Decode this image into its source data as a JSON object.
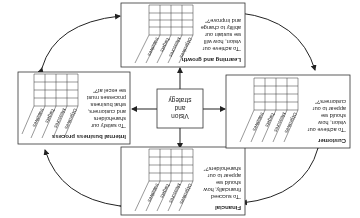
{
  "orientation": "rotated-180",
  "center": {
    "lines": [
      "Vision",
      "and",
      "strategy"
    ]
  },
  "columns": [
    "Objectives",
    "Measures",
    "Targets",
    "Initiatives"
  ],
  "perspectives": {
    "financial": {
      "title": "Financial",
      "question": [
        "“To succeed",
        "financially, how",
        "should we",
        "appear to our",
        "shareholders?”"
      ]
    },
    "customer": {
      "title": "Customer",
      "question": [
        "“To achieve our",
        "vision, how",
        "should we",
        "appear to our",
        "customers?”"
      ]
    },
    "internal": {
      "title": "Internal business process",
      "question": [
        "“To satisfy our",
        "shareholders",
        "and customers,",
        "what business",
        "processes must",
        "we excel at?”"
      ]
    },
    "learning": {
      "title": "Learning and growth",
      "question": [
        "“To achieve our",
        "vision, how will",
        "we sustain our",
        "ability to change",
        "and improve?”"
      ]
    }
  }
}
